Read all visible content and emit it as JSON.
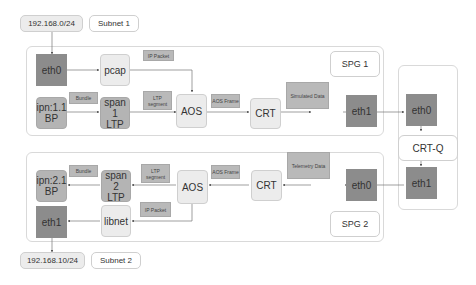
{
  "top": {
    "subnet_ip": "192.168.0/24",
    "subnet_name": "Subnet 1"
  },
  "bottom": {
    "subnet_ip": "192.168.10/24",
    "subnet_name": "Subnet 2"
  },
  "spg1": {
    "title": "SPG 1",
    "eth0": "eth0",
    "pcap": "pcap",
    "bp_line1": "ipn:1.1",
    "bp_line2": "BP",
    "ltp_line1": "span 1",
    "ltp_line2": "LTP",
    "aos": "AOS",
    "crt": "CRT",
    "eth1": "eth1",
    "lbl_ip_packet": "IP Packet",
    "lbl_bundle": "Bundle",
    "lbl_ltp_segment": "LTP segment",
    "lbl_aos_frame": "AOS Frame",
    "lbl_simulated": "Simulated Data"
  },
  "crtq": {
    "eth0": "eth0",
    "name": "CRT-Q",
    "eth1": "eth1"
  },
  "spg2": {
    "title": "SPG 2",
    "bp_line1": "ipn:2.1",
    "bp_line2": "BP",
    "ltp_line1": "span 2",
    "ltp_line2": "LTP",
    "aos": "AOS",
    "crt": "CRT",
    "eth0": "eth0",
    "eth1": "eth1",
    "libnet": "libnet",
    "lbl_bundle": "Bundle",
    "lbl_ltp_segment": "LTP segment",
    "lbl_aos_frame": "AOS Frame",
    "lbl_telemetry": "Telemetry Data",
    "lbl_ip_packet": "IP Packet"
  }
}
